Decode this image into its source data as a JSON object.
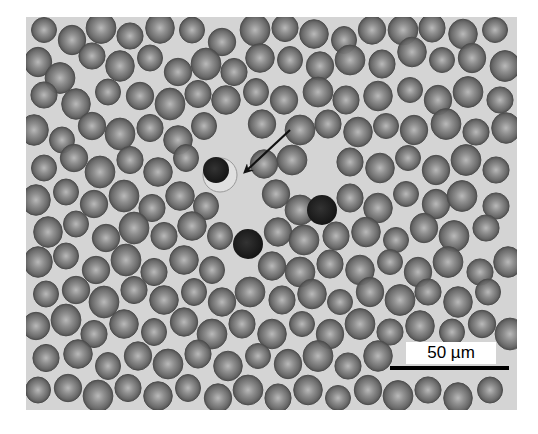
{
  "figure": {
    "frame": {
      "x": 26,
      "y": 17,
      "width": 491,
      "height": 393
    },
    "background_color": "#d4d4d4",
    "cell_color": "#6e6e6e",
    "cell_center_color": "#b4b4b4",
    "cell_edge_color": "#4e4e4e",
    "scale_bar": {
      "label": "50 µm",
      "label_box": {
        "x": 406,
        "y": 342,
        "width": 90,
        "height": 22
      },
      "bar": {
        "x": 390,
        "y": 366,
        "width": 119,
        "height": 4
      }
    },
    "arrow": {
      "x1": 290,
      "y1": 130,
      "x2": 246,
      "y2": 171,
      "color": "#111111"
    },
    "highlighted_cells": [
      {
        "name": "arrowed-cell",
        "cx": 220,
        "cy": 175,
        "r": 17,
        "halo_color": "#e0e0e0",
        "nucleus": {
          "cx": 216,
          "cy": 170,
          "r": 13
        },
        "color": "#2c2c2c"
      },
      {
        "name": "dark-cell-right",
        "cx": 322,
        "cy": 210,
        "r": 15,
        "color": "#222222"
      },
      {
        "name": "dark-cell-left",
        "cx": 248,
        "cy": 244,
        "r": 15,
        "color": "#232323"
      }
    ],
    "cells": [
      [
        44,
        30
      ],
      [
        72,
        40
      ],
      [
        101,
        28
      ],
      [
        130,
        36
      ],
      [
        160,
        28
      ],
      [
        192,
        30
      ],
      [
        222,
        42
      ],
      [
        255,
        30
      ],
      [
        285,
        28
      ],
      [
        314,
        34
      ],
      [
        344,
        40
      ],
      [
        372,
        30
      ],
      [
        403,
        30
      ],
      [
        432,
        28
      ],
      [
        463,
        34
      ],
      [
        495,
        30
      ],
      [
        38,
        62
      ],
      [
        60,
        78
      ],
      [
        92,
        56
      ],
      [
        120,
        66
      ],
      [
        150,
        58
      ],
      [
        178,
        72
      ],
      [
        206,
        64
      ],
      [
        234,
        72
      ],
      [
        260,
        58
      ],
      [
        290,
        60
      ],
      [
        320,
        66
      ],
      [
        350,
        60
      ],
      [
        382,
        64
      ],
      [
        412,
        52
      ],
      [
        442,
        60
      ],
      [
        472,
        58
      ],
      [
        505,
        66
      ],
      [
        44,
        95
      ],
      [
        76,
        104
      ],
      [
        108,
        92
      ],
      [
        140,
        96
      ],
      [
        170,
        104
      ],
      [
        198,
        94
      ],
      [
        226,
        100
      ],
      [
        256,
        92
      ],
      [
        284,
        100
      ],
      [
        318,
        92
      ],
      [
        346,
        100
      ],
      [
        378,
        96
      ],
      [
        410,
        90
      ],
      [
        438,
        100
      ],
      [
        468,
        92
      ],
      [
        500,
        100
      ],
      [
        34,
        130
      ],
      [
        62,
        140
      ],
      [
        92,
        126
      ],
      [
        120,
        134
      ],
      [
        150,
        128
      ],
      [
        178,
        140
      ],
      [
        204,
        126
      ],
      [
        262,
        124
      ],
      [
        300,
        130
      ],
      [
        328,
        124
      ],
      [
        358,
        132
      ],
      [
        386,
        126
      ],
      [
        414,
        130
      ],
      [
        446,
        124
      ],
      [
        476,
        132
      ],
      [
        506,
        128
      ],
      [
        44,
        168
      ],
      [
        74,
        158
      ],
      [
        100,
        172
      ],
      [
        130,
        160
      ],
      [
        158,
        172
      ],
      [
        186,
        158
      ],
      [
        264,
        164
      ],
      [
        292,
        160
      ],
      [
        350,
        162
      ],
      [
        380,
        168
      ],
      [
        408,
        158
      ],
      [
        436,
        170
      ],
      [
        466,
        160
      ],
      [
        496,
        170
      ],
      [
        36,
        200
      ],
      [
        66,
        192
      ],
      [
        94,
        204
      ],
      [
        124,
        196
      ],
      [
        152,
        208
      ],
      [
        180,
        196
      ],
      [
        206,
        206
      ],
      [
        276,
        194
      ],
      [
        300,
        210
      ],
      [
        350,
        198
      ],
      [
        378,
        208
      ],
      [
        406,
        194
      ],
      [
        436,
        204
      ],
      [
        462,
        196
      ],
      [
        496,
        206
      ],
      [
        48,
        232
      ],
      [
        76,
        224
      ],
      [
        106,
        238
      ],
      [
        134,
        228
      ],
      [
        164,
        236
      ],
      [
        192,
        226
      ],
      [
        220,
        236
      ],
      [
        278,
        232
      ],
      [
        304,
        240
      ],
      [
        336,
        236
      ],
      [
        366,
        232
      ],
      [
        396,
        240
      ],
      [
        424,
        228
      ],
      [
        454,
        236
      ],
      [
        486,
        228
      ],
      [
        38,
        262
      ],
      [
        66,
        256
      ],
      [
        96,
        270
      ],
      [
        126,
        260
      ],
      [
        154,
        272
      ],
      [
        184,
        260
      ],
      [
        212,
        270
      ],
      [
        272,
        266
      ],
      [
        300,
        272
      ],
      [
        330,
        264
      ],
      [
        360,
        270
      ],
      [
        390,
        262
      ],
      [
        418,
        272
      ],
      [
        448,
        262
      ],
      [
        480,
        272
      ],
      [
        508,
        262
      ],
      [
        46,
        294
      ],
      [
        76,
        290
      ],
      [
        104,
        302
      ],
      [
        134,
        290
      ],
      [
        164,
        300
      ],
      [
        194,
        292
      ],
      [
        222,
        302
      ],
      [
        250,
        292
      ],
      [
        282,
        300
      ],
      [
        312,
        294
      ],
      [
        340,
        302
      ],
      [
        370,
        292
      ],
      [
        400,
        300
      ],
      [
        428,
        292
      ],
      [
        458,
        302
      ],
      [
        488,
        292
      ],
      [
        36,
        326
      ],
      [
        66,
        320
      ],
      [
        94,
        334
      ],
      [
        124,
        324
      ],
      [
        154,
        332
      ],
      [
        184,
        322
      ],
      [
        212,
        334
      ],
      [
        242,
        324
      ],
      [
        272,
        334
      ],
      [
        302,
        324
      ],
      [
        330,
        334
      ],
      [
        360,
        324
      ],
      [
        390,
        332
      ],
      [
        420,
        326
      ],
      [
        452,
        332
      ],
      [
        482,
        324
      ],
      [
        510,
        334
      ],
      [
        46,
        358
      ],
      [
        78,
        354
      ],
      [
        108,
        366
      ],
      [
        138,
        356
      ],
      [
        168,
        364
      ],
      [
        198,
        354
      ],
      [
        228,
        366
      ],
      [
        258,
        356
      ],
      [
        288,
        364
      ],
      [
        318,
        356
      ],
      [
        348,
        366
      ],
      [
        378,
        356
      ],
      [
        38,
        390
      ],
      [
        68,
        388
      ],
      [
        98,
        396
      ],
      [
        128,
        388
      ],
      [
        158,
        396
      ],
      [
        188,
        388
      ],
      [
        218,
        398
      ],
      [
        248,
        390
      ],
      [
        278,
        398
      ],
      [
        308,
        390
      ],
      [
        338,
        398
      ],
      [
        368,
        390
      ],
      [
        398,
        396
      ],
      [
        428,
        390
      ],
      [
        458,
        398
      ],
      [
        490,
        390
      ]
    ]
  }
}
